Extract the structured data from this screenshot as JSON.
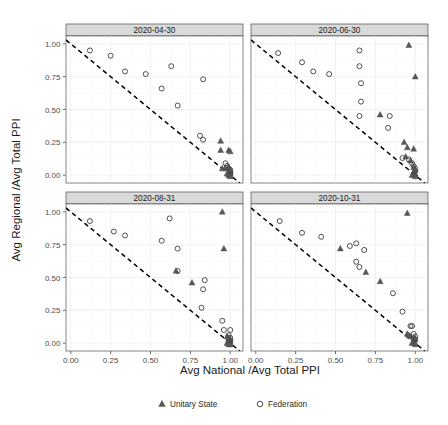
{
  "chart_data": {
    "type": "scatter",
    "title": "",
    "xlabel": "Avg National /Avg Total PPI",
    "ylabel": "Avg Regional /Avg Total PPI",
    "xlim": [
      -0.03,
      1.08
    ],
    "ylim": [
      -0.06,
      1.06
    ],
    "xticks": [
      "0.00",
      "0.25",
      "0.50",
      "0.75",
      "1.00"
    ],
    "xtick_values": [
      0.0,
      0.25,
      0.5,
      0.75,
      1.0
    ],
    "yticks": [
      "0.00",
      "0.25",
      "0.50",
      "0.75",
      "1.00"
    ],
    "ytick_values": [
      0.0,
      0.25,
      0.5,
      0.75,
      1.0
    ],
    "grid": true,
    "legend_position": "bottom",
    "reference_line": {
      "label": "x + y = 1",
      "style": "dashed",
      "from": [
        -0.03,
        1.03
      ],
      "to": [
        1.06,
        -0.06
      ]
    },
    "legend": [
      {
        "name": "Unitary State",
        "marker": "filled-triangle",
        "color": "#595959"
      },
      {
        "name": "Federation",
        "marker": "open-circle",
        "color": "#3d3d3d"
      }
    ],
    "facets": [
      {
        "label": "2020-04-30",
        "series": [
          {
            "name": "Federation",
            "points": [
              [
                0.12,
                0.95
              ],
              [
                0.25,
                0.91
              ],
              [
                0.34,
                0.79
              ],
              [
                0.47,
                0.77
              ],
              [
                0.57,
                0.66
              ],
              [
                0.63,
                0.83
              ],
              [
                0.67,
                0.53
              ],
              [
                0.83,
                0.73
              ],
              [
                0.81,
                0.3
              ],
              [
                0.83,
                0.27
              ],
              [
                0.97,
                0.09
              ],
              [
                0.98,
                0.07
              ],
              [
                0.99,
                0.05
              ],
              [
                1.0,
                0.04
              ],
              [
                1.0,
                0.02
              ],
              [
                1.0,
                0.01
              ]
            ]
          },
          {
            "name": "Unitary State",
            "points": [
              [
                0.94,
                0.26
              ],
              [
                0.94,
                0.19
              ],
              [
                0.99,
                0.19
              ],
              [
                1.0,
                0.18
              ],
              [
                0.95,
                0.05
              ],
              [
                0.97,
                0.05
              ],
              [
                0.99,
                0.06
              ],
              [
                1.0,
                0.04
              ],
              [
                0.99,
                0.02
              ],
              [
                1.0,
                0.01
              ],
              [
                1.0,
                0.0
              ],
              [
                0.99,
                0.0
              ],
              [
                1.0,
                -0.01
              ],
              [
                0.98,
                0.01
              ]
            ]
          }
        ]
      },
      {
        "label": "2020-06-30",
        "series": [
          {
            "name": "Federation",
            "points": [
              [
                0.14,
                0.93
              ],
              [
                0.29,
                0.86
              ],
              [
                0.36,
                0.79
              ],
              [
                0.46,
                0.77
              ],
              [
                0.65,
                0.95
              ],
              [
                0.65,
                0.83
              ],
              [
                0.66,
                0.7
              ],
              [
                0.66,
                0.56
              ],
              [
                0.65,
                0.45
              ],
              [
                0.84,
                0.45
              ],
              [
                0.83,
                0.36
              ],
              [
                0.96,
                0.12
              ],
              [
                0.98,
                0.09
              ],
              [
                0.99,
                0.07
              ],
              [
                1.0,
                0.05
              ],
              [
                1.0,
                0.03
              ],
              [
                0.92,
                0.13
              ]
            ]
          },
          {
            "name": "Unitary State",
            "points": [
              [
                0.96,
                0.99
              ],
              [
                1.0,
                0.75
              ],
              [
                0.78,
                0.46
              ],
              [
                0.93,
                0.25
              ],
              [
                0.95,
                0.21
              ],
              [
                0.99,
                0.2
              ],
              [
                0.94,
                0.14
              ],
              [
                0.97,
                0.11
              ],
              [
                0.99,
                0.06
              ],
              [
                1.0,
                0.04
              ],
              [
                0.99,
                0.02
              ],
              [
                1.0,
                0.01
              ],
              [
                1.0,
                0.0
              ],
              [
                0.98,
                0.0
              ],
              [
                1.0,
                -0.01
              ]
            ]
          }
        ]
      },
      {
        "label": "2020-08-31",
        "series": [
          {
            "name": "Federation",
            "points": [
              [
                0.12,
                0.93
              ],
              [
                0.27,
                0.85
              ],
              [
                0.34,
                0.82
              ],
              [
                0.57,
                0.78
              ],
              [
                0.62,
                0.95
              ],
              [
                0.67,
                0.72
              ],
              [
                0.67,
                0.55
              ],
              [
                0.84,
                0.48
              ],
              [
                0.83,
                0.41
              ],
              [
                0.82,
                0.27
              ],
              [
                0.95,
                0.17
              ],
              [
                0.96,
                0.1
              ],
              [
                1.0,
                0.1
              ],
              [
                0.99,
                0.06
              ],
              [
                1.0,
                0.04
              ],
              [
                1.0,
                0.02
              ]
            ]
          },
          {
            "name": "Unitary State",
            "points": [
              [
                0.95,
                1.0
              ],
              [
                0.96,
                0.72
              ],
              [
                0.66,
                0.55
              ],
              [
                0.76,
                0.46
              ],
              [
                0.98,
                0.05
              ],
              [
                0.99,
                0.04
              ],
              [
                1.0,
                0.03
              ],
              [
                0.99,
                0.02
              ],
              [
                1.0,
                0.01
              ],
              [
                1.0,
                0.0
              ],
              [
                0.98,
                0.0
              ],
              [
                1.0,
                -0.01
              ],
              [
                0.99,
                -0.01
              ]
            ]
          }
        ]
      },
      {
        "label": "2020-10-31",
        "series": [
          {
            "name": "Federation",
            "points": [
              [
                0.15,
                0.93
              ],
              [
                0.29,
                0.84
              ],
              [
                0.41,
                0.81
              ],
              [
                0.59,
                0.74
              ],
              [
                0.63,
                0.76
              ],
              [
                0.68,
                0.71
              ],
              [
                0.65,
                0.58
              ],
              [
                0.63,
                0.62
              ],
              [
                0.86,
                0.38
              ],
              [
                0.92,
                0.24
              ],
              [
                0.97,
                0.13
              ],
              [
                0.98,
                0.13
              ],
              [
                0.99,
                0.07
              ],
              [
                1.0,
                0.05
              ],
              [
                1.0,
                0.03
              ]
            ]
          },
          {
            "name": "Unitary State",
            "points": [
              [
                0.95,
                0.99
              ],
              [
                0.53,
                0.72
              ],
              [
                0.69,
                0.54
              ],
              [
                0.78,
                0.47
              ],
              [
                0.95,
                0.07
              ],
              [
                0.97,
                0.05
              ],
              [
                0.99,
                0.04
              ],
              [
                1.0,
                0.03
              ],
              [
                0.99,
                0.01
              ],
              [
                1.0,
                0.0
              ],
              [
                0.98,
                0.0
              ],
              [
                1.0,
                -0.01
              ],
              [
                0.96,
                0.06
              ]
            ]
          }
        ]
      }
    ]
  }
}
